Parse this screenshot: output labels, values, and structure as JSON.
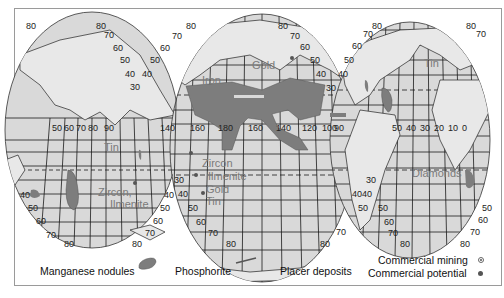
{
  "map": {
    "title": "Ocean mineral resources",
    "projection": "interrupted ellipse (three lobes)",
    "lobes": [
      {
        "name": "indian-ocean-lobe",
        "left_lat_labels": [
          "80",
          "70",
          "60",
          "50",
          "40",
          "30"
        ],
        "lon_labels": [
          "50",
          "60",
          "70",
          "80",
          "90"
        ],
        "bottom_lat_labels": [
          "40",
          "50",
          "60",
          "70",
          "80"
        ]
      },
      {
        "name": "pacific-ocean-lobe",
        "lat_labels": [
          "80",
          "70",
          "60",
          "50",
          "40",
          "30"
        ],
        "lon_labels": [
          "140",
          "160",
          "180",
          "160",
          "140",
          "120",
          "100"
        ],
        "bottom_lat_labels": [
          "30",
          "40",
          "50",
          "60",
          "70",
          "80"
        ]
      },
      {
        "name": "atlantic-ocean-lobe",
        "lat_labels": [
          "80",
          "70",
          "60",
          "50",
          "40"
        ],
        "lon_labels": [
          "90",
          "50",
          "40",
          "30",
          "20",
          "10",
          "0"
        ],
        "bottom_lat_labels": [
          "30",
          "40",
          "50",
          "60",
          "70",
          "80"
        ]
      }
    ],
    "resource_labels": {
      "tin_indian": "Tin",
      "zircon_ilmenite_indian_1": "Zircon,",
      "zircon_ilmenite_indian_2": "Ilmenite",
      "iron": "Iron",
      "gold_north": "Gold",
      "zircon_pacific": "Zircon",
      "ilmenite_pacific": "Ilmenite",
      "gold_pacific": "Gold",
      "tin_pacific": "Tin",
      "tin_atlantic": "Tin",
      "diamonds": "Diamonds"
    },
    "labels": {
      "l80a": "80",
      "l80b": "80",
      "l70a": "70",
      "l60a": "60",
      "l50a": "50",
      "l40a": "40",
      "l30a": "30",
      "lon50": "50",
      "lon60": "60",
      "lon70": "70",
      "lon80": "80",
      "lon90": "90",
      "b40": "40",
      "b50": "50",
      "b60": "60",
      "b70": "70",
      "b80": "80",
      "r40": "40",
      "r50": "50",
      "r60": "60",
      "r70": "70",
      "r80": "80",
      "p80a": "80",
      "p70a": "70",
      "p60a": "60",
      "p50a": "50",
      "p40a": "40",
      "p80b": "80",
      "p70b": "70",
      "p60b": "60",
      "p50b": "50",
      "p40b": "40",
      "p30b": "30",
      "plon140": "140",
      "plon160": "160",
      "plon180": "180",
      "plon160b": "160",
      "plon140b": "140",
      "plon120": "120",
      "plon100": "100",
      "pb30": "30",
      "pb40": "40",
      "pb50": "50",
      "pb60": "60",
      "pb70": "70",
      "pb80": "80",
      "pr70": "70",
      "pr80": "80",
      "a80": "80",
      "a70": "70",
      "a60": "60",
      "a50": "50",
      "a40": "40",
      "a80b": "80",
      "a70b": "70",
      "alon90": "90",
      "alon50": "50",
      "alon40": "40",
      "alon30": "30",
      "alon20": "20",
      "alon10": "10",
      "alon0": "0",
      "ab30": "30",
      "ab40": "40",
      "ab50": "50",
      "ab60": "60",
      "ab70": "70",
      "ab80": "80",
      "ar50": "50",
      "ar60": "60",
      "ar70": "70",
      "ar80": "80",
      "ac50": "50",
      "ac40": "40"
    }
  },
  "legend": {
    "manganese_nodules": "Manganese nodules",
    "phosphorite": "Phosphorite",
    "placer_deposits": "Placer deposits",
    "commercial_mining": "Commercial mining",
    "commercial_potential": "Commercial potential"
  },
  "colors": {
    "ocean_fill": "#d9d9d9",
    "nodule_fill": "#7d7d7d",
    "grid": "#1a1a1a",
    "resource_text": "#7a7a7a",
    "frame": "#9a9a9a"
  }
}
